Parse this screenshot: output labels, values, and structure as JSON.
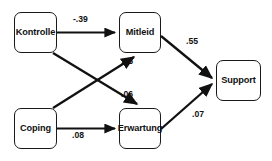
{
  "diagram": {
    "type": "path-diagram",
    "background_color": "#ffffff",
    "line_color": "#111111",
    "box_border_color": "#1a1a1a",
    "nodes": [
      {
        "id": "kontrolle",
        "label": "Kontrolle",
        "x": 14,
        "y": 12,
        "w": 43,
        "h": 41
      },
      {
        "id": "mitleid",
        "label": "Mitleid",
        "x": 119,
        "y": 12,
        "w": 42,
        "h": 41
      },
      {
        "id": "coping",
        "label": "Coping",
        "x": 14,
        "y": 108,
        "w": 43,
        "h": 41
      },
      {
        "id": "erwartung",
        "label": "Erwartung",
        "x": 119,
        "y": 108,
        "w": 42,
        "h": 41
      },
      {
        "id": "support",
        "label": "Support",
        "x": 216,
        "y": 60,
        "w": 45,
        "h": 41
      }
    ],
    "edges": [
      {
        "id": "kontrolle-mitleid",
        "from": "Kontrolle",
        "to": "Mitleid",
        "label": "-.39",
        "label_x": 73,
        "label_y": 15
      },
      {
        "id": "coping-mitleid",
        "from": "Coping",
        "to": "Mitleid",
        "label": ".25",
        "label_x": 121,
        "label_y": 57
      },
      {
        "id": "kontrolle-erwartung",
        "from": "Kontrolle",
        "to": "Erwartung",
        "label": ".06",
        "label_x": 121,
        "label_y": 90
      },
      {
        "id": "coping-erwartung",
        "from": "Coping",
        "to": "Erwartung",
        "label": ".08",
        "label_x": 72,
        "label_y": 131
      },
      {
        "id": "mitleid-support",
        "from": "Mitleid",
        "to": "Support",
        "label": ".55",
        "label_x": 186,
        "label_y": 37
      },
      {
        "id": "erwartung-support",
        "from": "Erwartung",
        "to": "Support",
        "label": ".07",
        "label_x": 192,
        "label_y": 110
      }
    ]
  }
}
